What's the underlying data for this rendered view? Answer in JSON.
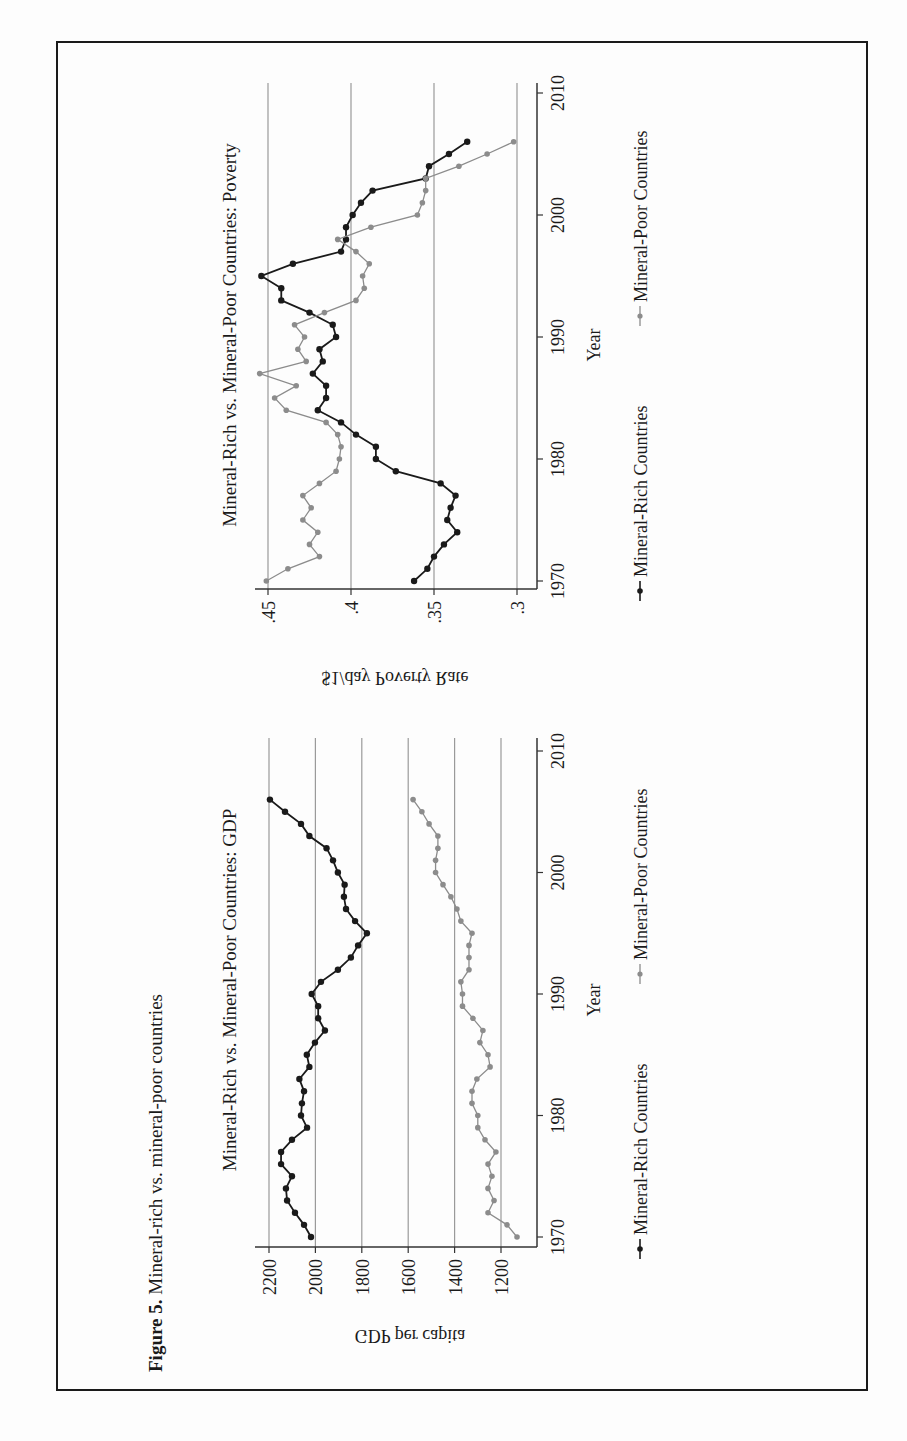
{
  "figure": {
    "caption_label": "Figure 5.",
    "caption_text": " Mineral-rich vs. mineral-poor countries",
    "orientation": "rotated 90° counterclockwise"
  },
  "legend": {
    "rich_label": "Mineral-Rich Countries",
    "poor_label": "Mineral-Poor Countries"
  },
  "colors": {
    "rich": "#1a1a1a",
    "poor": "#8c8c8c",
    "grid": "#9a9a9a",
    "axis": "#333333",
    "frame": "#1a1a1a"
  },
  "chart_data": [
    {
      "type": "line",
      "title": "Mineral-Rich vs. Mineral-Poor Countries: GDP",
      "xlabel": "Year",
      "ylabel": "GDP per capita",
      "x_ticks": [
        1970,
        1980,
        1990,
        2000,
        2010
      ],
      "y_ticks": [
        1200,
        1400,
        1600,
        1800,
        2000,
        2200
      ],
      "y_tick_labels": [
        "1200",
        "1400",
        "1600",
        "1800",
        "2000",
        "2200"
      ],
      "xlim": [
        1969,
        2011
      ],
      "ylim": [
        1120,
        2220
      ],
      "grid": true,
      "legend_position": "bottom",
      "x": [
        1970,
        1971,
        1972,
        1973,
        1974,
        1975,
        1976,
        1977,
        1978,
        1979,
        1980,
        1981,
        1982,
        1983,
        1984,
        1985,
        1986,
        1987,
        1988,
        1989,
        1990,
        1991,
        1992,
        1993,
        1994,
        1995,
        1996,
        1997,
        1998,
        1999,
        2000,
        2001,
        2002,
        2003,
        2004,
        2005,
        2006
      ],
      "series": [
        {
          "name": "Mineral-Rich Countries",
          "values": [
            2019,
            2049,
            2088,
            2122,
            2127,
            2101,
            2148,
            2148,
            2101,
            2036,
            2062,
            2058,
            2049,
            2069,
            2026,
            2037,
            2002,
            1959,
            1988,
            1988,
            2016,
            1976,
            1903,
            1847,
            1816,
            1778,
            1829,
            1868,
            1877,
            1874,
            1903,
            1924,
            1952,
            2026,
            2062,
            2131,
            2196
          ]
        },
        {
          "name": "Mineral-Poor Countries",
          "values": [
            1131,
            1174,
            1256,
            1230,
            1256,
            1239,
            1256,
            1222,
            1269,
            1300,
            1300,
            1325,
            1325,
            1304,
            1247,
            1256,
            1291,
            1278,
            1321,
            1366,
            1366,
            1373,
            1338,
            1338,
            1338,
            1325,
            1373,
            1390,
            1416,
            1450,
            1482,
            1482,
            1472,
            1472,
            1510,
            1541,
            1579
          ]
        }
      ]
    },
    {
      "type": "line",
      "title": "Mineral-Rich vs. Mineral-Poor Countries: Poverty",
      "xlabel": "Year",
      "ylabel": "$1/day Poverty Rate",
      "x_ticks": [
        1970,
        1980,
        1990,
        2000,
        2010
      ],
      "y_ticks": [
        0.3,
        0.35,
        0.4,
        0.45
      ],
      "y_tick_labels": [
        ".3",
        ".35",
        ".4",
        ".45"
      ],
      "xlim": [
        1969,
        2011
      ],
      "ylim": [
        0.29,
        0.46
      ],
      "grid": true,
      "legend_position": "bottom",
      "x": [
        1970,
        1971,
        1972,
        1973,
        1974,
        1975,
        1976,
        1977,
        1978,
        1979,
        1980,
        1981,
        1982,
        1983,
        1984,
        1985,
        1986,
        1987,
        1988,
        1989,
        1990,
        1991,
        1992,
        1993,
        1994,
        1995,
        1996,
        1997,
        1998,
        1999,
        2000,
        2001,
        2002,
        2003,
        2004,
        2005,
        2006
      ],
      "series": [
        {
          "name": "Mineral-Rich Countries",
          "values": [
            0.362,
            0.354,
            0.35,
            0.344,
            0.336,
            0.342,
            0.34,
            0.337,
            0.346,
            0.373,
            0.385,
            0.385,
            0.397,
            0.406,
            0.42,
            0.415,
            0.415,
            0.423,
            0.417,
            0.419,
            0.409,
            0.411,
            0.425,
            0.442,
            0.442,
            0.454,
            0.435,
            0.406,
            0.403,
            0.403,
            0.399,
            0.394,
            0.387,
            0.355,
            0.353,
            0.341,
            0.33
          ]
        },
        {
          "name": "Mineral-Poor Countries",
          "values": [
            0.451,
            0.438,
            0.419,
            0.425,
            0.42,
            0.429,
            0.424,
            0.429,
            0.419,
            0.409,
            0.407,
            0.406,
            0.408,
            0.415,
            0.439,
            0.446,
            0.433,
            0.455,
            0.427,
            0.432,
            0.428,
            0.434,
            0.416,
            0.397,
            0.392,
            0.393,
            0.389,
            0.397,
            0.408,
            0.388,
            0.36,
            0.357,
            0.355,
            0.355,
            0.335,
            0.318,
            0.302
          ]
        }
      ]
    }
  ]
}
